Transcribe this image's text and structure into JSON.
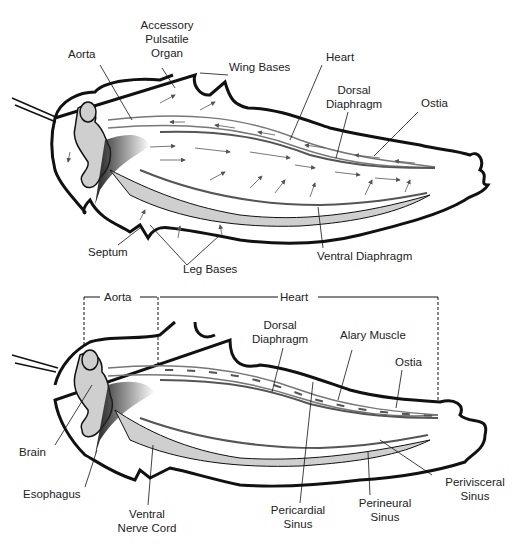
{
  "top_diagram": {
    "labels": {
      "aorta": "Aorta",
      "accessory": "Accessory",
      "pulsatile": "Pulsatile",
      "organ": "Organ",
      "wing_bases": "Wing Bases",
      "heart": "Heart",
      "dorsal": "Dorsal",
      "diaphragm": "Diaphragm",
      "ostia": "Ostia",
      "septum": "Septum",
      "leg_bases": "Leg Bases",
      "ventral_diaphragm": "Ventral Diaphragm"
    }
  },
  "bottom_diagram": {
    "labels": {
      "aorta": "Aorta",
      "heart": "Heart",
      "dorsal": "Dorsal",
      "diaphragm": "Diaphragm",
      "alary_muscle": "Alary Muscle",
      "ostia": "Ostia",
      "brain": "Brain",
      "esophagus": "Esophagus",
      "ventral": "Ventral",
      "nerve_cord": "Nerve Cord",
      "pericardial": "Pericardial",
      "pericardial_sinus": "Sinus",
      "perineural": "Perineural",
      "perineural_sinus": "Sinus",
      "perivisceral": "Perivisceral",
      "perivisceral_sinus": "Sinus"
    }
  },
  "colors": {
    "outline": "#111111",
    "organ_fill": "#cfcfcf",
    "vessel": "#777777",
    "dark": "#333333"
  }
}
